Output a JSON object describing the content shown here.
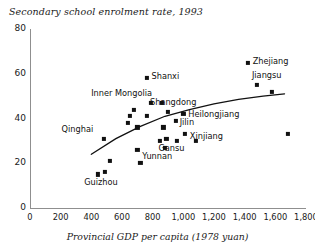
{
  "chart_data": {
    "type": "scatter",
    "title": "Secondary school enrolment rate, 1993",
    "xlabel": "Provincial GDP per capita (1978 yuan)",
    "ylabel": "",
    "xlim": [
      0,
      1800
    ],
    "ylim": [
      0,
      80
    ],
    "grid": false,
    "legend": "none",
    "xticks": [
      "0",
      "200",
      "400",
      "600",
      "800",
      "1,000",
      "1,200",
      "1,400",
      "1,600",
      "1,800"
    ],
    "xtick_values": [
      0,
      200,
      400,
      600,
      800,
      1000,
      1200,
      1400,
      1600,
      1800
    ],
    "yticks": [
      "0",
      "20",
      "40",
      "60",
      "80"
    ],
    "ytick_values": [
      0,
      20,
      40,
      60,
      80
    ],
    "points": [
      {
        "label": "Qinghai",
        "x": 480,
        "y": 31
      },
      {
        "label": "",
        "x": 520,
        "y": 21
      },
      {
        "label": "Guizhou",
        "x": 445,
        "y": 15
      },
      {
        "label": "",
        "x": 490,
        "y": 16
      },
      {
        "label": "",
        "x": 640,
        "y": 38
      },
      {
        "label": "",
        "x": 650,
        "y": 41
      },
      {
        "label": "",
        "x": 680,
        "y": 44
      },
      {
        "label": "",
        "x": 700,
        "y": 36
      },
      {
        "label": "",
        "x": 720,
        "y": 20
      },
      {
        "label": "Shanxi",
        "x": 760,
        "y": 58
      },
      {
        "label": "Inner Mongolia",
        "x": 790,
        "y": 47
      },
      {
        "label": "",
        "x": 760,
        "y": 41
      },
      {
        "label": "Yunnan",
        "x": 700,
        "y": 26
      },
      {
        "label": "",
        "x": 860,
        "y": 47
      },
      {
        "label": "",
        "x": 870,
        "y": 36
      },
      {
        "label": "",
        "x": 845,
        "y": 30
      },
      {
        "label": "",
        "x": 880,
        "y": 27
      },
      {
        "label": "Gansu",
        "x": 890,
        "y": 31
      },
      {
        "label": "Shangdong",
        "x": 900,
        "y": 43
      },
      {
        "label": "",
        "x": 960,
        "y": 30
      },
      {
        "label": "Heilongjiang",
        "x": 1000,
        "y": 42
      },
      {
        "label": "Jilin",
        "x": 950,
        "y": 39
      },
      {
        "label": "Xinjiang",
        "x": 1010,
        "y": 33
      },
      {
        "label": "",
        "x": 1080,
        "y": 30
      },
      {
        "label": "Zhejiang",
        "x": 1420,
        "y": 65
      },
      {
        "label": "Jiangsu",
        "x": 1480,
        "y": 55
      },
      {
        "label": "",
        "x": 1580,
        "y": 52
      },
      {
        "label": "",
        "x": 1680,
        "y": 33
      }
    ],
    "trend_line": {
      "label": "fitted-curve",
      "x": [
        400,
        560,
        720,
        880,
        1040,
        1200,
        1360,
        1520,
        1660
      ],
      "y": [
        24,
        31,
        36.5,
        41,
        44,
        46.5,
        48.5,
        50,
        51
      ]
    }
  },
  "labels": {
    "qinghai": "Qinghai",
    "guizhou": "Guizhou",
    "yunnan": "Yunnan",
    "shanxi": "Shanxi",
    "inner_mongolia": "Inner Mongolia",
    "gansu": "Gansu",
    "shangdong": "Shangdong",
    "heilongjiang": "Heilongjiang",
    "jilin": "Jilin",
    "xinjiang": "Xinjiang",
    "zhejiang": "Zhejiang",
    "jiangsu": "Jiangsu"
  }
}
